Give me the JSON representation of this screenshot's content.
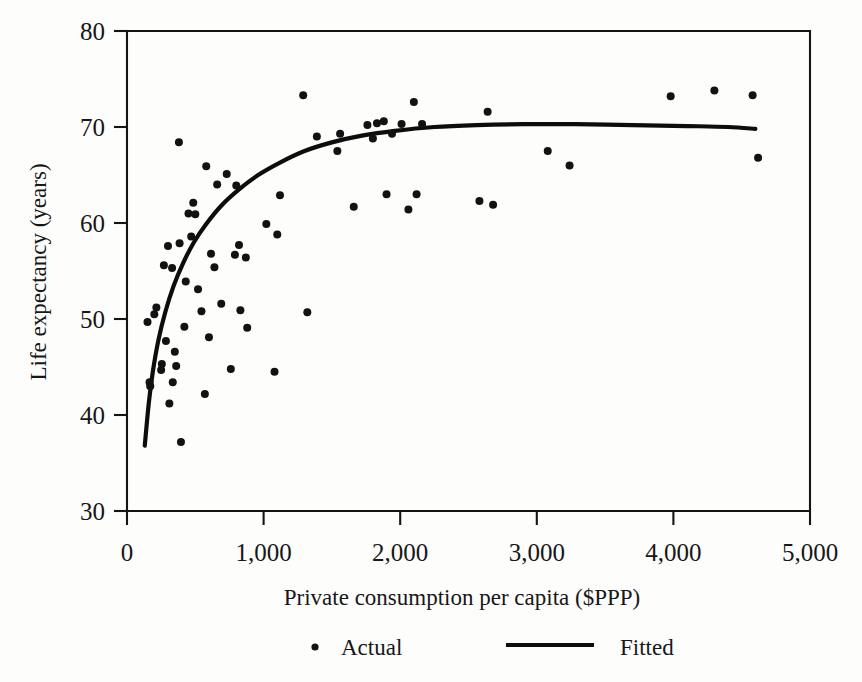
{
  "chart_data": {
    "type": "scatter",
    "title": "",
    "xlabel": "Private consumption per capita ($PPP)",
    "ylabel": "Life expectancy (years)",
    "xlim": [
      0,
      5000
    ],
    "ylim": [
      30,
      80
    ],
    "xticks": [
      0,
      1000,
      2000,
      3000,
      4000,
      5000
    ],
    "xtick_labels": [
      "0",
      "1,000",
      "2,000",
      "3,000",
      "4,000",
      "5,000"
    ],
    "yticks": [
      30,
      40,
      50,
      60,
      70,
      80
    ],
    "ytick_labels": [
      "30",
      "40",
      "50",
      "60",
      "70",
      "80"
    ],
    "grid": false,
    "legend_position": "below-axis-title",
    "series": [
      {
        "name": "Actual",
        "type": "scatter",
        "marker": "dot",
        "color": "#121212",
        "points": [
          [
            150,
            49.7
          ],
          [
            165,
            43.4
          ],
          [
            170,
            43.0
          ],
          [
            200,
            50.5
          ],
          [
            215,
            51.2
          ],
          [
            250,
            44.7
          ],
          [
            255,
            45.3
          ],
          [
            270,
            55.6
          ],
          [
            285,
            47.7
          ],
          [
            300,
            57.6
          ],
          [
            310,
            41.2
          ],
          [
            330,
            55.3
          ],
          [
            335,
            43.4
          ],
          [
            350,
            46.6
          ],
          [
            360,
            45.1
          ],
          [
            380,
            68.4
          ],
          [
            385,
            57.9
          ],
          [
            395,
            37.2
          ],
          [
            420,
            49.2
          ],
          [
            430,
            53.9
          ],
          [
            450,
            61.0
          ],
          [
            470,
            58.6
          ],
          [
            485,
            62.1
          ],
          [
            500,
            60.9
          ],
          [
            520,
            53.1
          ],
          [
            545,
            50.8
          ],
          [
            570,
            42.2
          ],
          [
            580,
            65.9
          ],
          [
            600,
            48.1
          ],
          [
            615,
            56.8
          ],
          [
            640,
            55.4
          ],
          [
            660,
            64.0
          ],
          [
            690,
            51.6
          ],
          [
            730,
            65.1
          ],
          [
            760,
            44.8
          ],
          [
            790,
            56.7
          ],
          [
            800,
            63.9
          ],
          [
            820,
            57.7
          ],
          [
            830,
            50.9
          ],
          [
            870,
            56.4
          ],
          [
            880,
            49.1
          ],
          [
            1020,
            59.9
          ],
          [
            1080,
            44.5
          ],
          [
            1100,
            58.8
          ],
          [
            1120,
            62.9
          ],
          [
            1290,
            73.3
          ],
          [
            1320,
            50.7
          ],
          [
            1390,
            69.0
          ],
          [
            1540,
            67.5
          ],
          [
            1560,
            69.3
          ],
          [
            1660,
            61.7
          ],
          [
            1760,
            70.2
          ],
          [
            1800,
            68.8
          ],
          [
            1830,
            70.4
          ],
          [
            1880,
            70.6
          ],
          [
            1900,
            63.0
          ],
          [
            1940,
            69.3
          ],
          [
            2010,
            70.3
          ],
          [
            2060,
            61.4
          ],
          [
            2100,
            72.6
          ],
          [
            2120,
            63.0
          ],
          [
            2160,
            70.3
          ],
          [
            2580,
            62.3
          ],
          [
            2640,
            71.6
          ],
          [
            2680,
            61.9
          ],
          [
            3080,
            67.5
          ],
          [
            3240,
            66.0
          ],
          [
            3980,
            73.2
          ],
          [
            4300,
            73.8
          ],
          [
            4580,
            73.3
          ],
          [
            4620,
            66.8
          ]
        ]
      },
      {
        "name": "Fitted",
        "type": "line",
        "color": "#0d0d0d",
        "description": "Logarithmic fit of life expectancy against private consumption per capita",
        "points": [
          [
            130,
            36.8
          ],
          [
            160,
            41.3
          ],
          [
            190,
            44.6
          ],
          [
            230,
            47.8
          ],
          [
            280,
            50.7
          ],
          [
            340,
            53.4
          ],
          [
            410,
            55.8
          ],
          [
            490,
            58.0
          ],
          [
            580,
            59.9
          ],
          [
            690,
            61.8
          ],
          [
            820,
            63.5
          ],
          [
            960,
            65.0
          ],
          [
            1120,
            66.3
          ],
          [
            1300,
            67.5
          ],
          [
            1500,
            68.4
          ],
          [
            1720,
            69.1
          ],
          [
            1960,
            69.6
          ],
          [
            2250,
            70.0
          ],
          [
            2560,
            70.2
          ],
          [
            2900,
            70.3
          ],
          [
            3280,
            70.3
          ],
          [
            3700,
            70.2
          ],
          [
            4100,
            70.1
          ],
          [
            4400,
            70.0
          ],
          [
            4600,
            69.8
          ]
        ]
      }
    ],
    "legend": [
      {
        "label": "Actual",
        "marker": "dot"
      },
      {
        "label": "Fitted",
        "marker": "line"
      }
    ]
  }
}
